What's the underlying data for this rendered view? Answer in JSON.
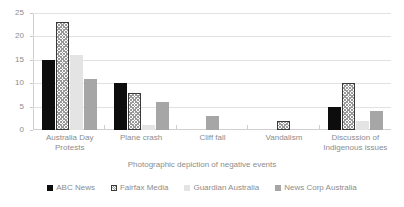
{
  "chart_data": {
    "type": "bar",
    "title": "",
    "xlabel": "Photographic depiction of negative events",
    "ylabel": "",
    "ylim": [
      0,
      25
    ],
    "yticks": [
      0,
      5,
      10,
      15,
      20,
      25
    ],
    "grid": true,
    "legend_position": "bottom",
    "categories": [
      "Australia Day Protests",
      "Plane crash",
      "Cliff fall",
      "Vandalism",
      "Discussion of Indigenous issues"
    ],
    "series": [
      {
        "name": "ABC News",
        "color": "#0d0d0d",
        "values": [
          15,
          10,
          0,
          0,
          5
        ]
      },
      {
        "name": "Fairfax Media",
        "color": "#ffffff",
        "values": [
          23,
          8,
          0,
          2,
          10
        ]
      },
      {
        "name": "Guardian Australia",
        "color": "#e4e4e4",
        "values": [
          16,
          1,
          0,
          0,
          2
        ]
      },
      {
        "name": "News Corp Australia",
        "color": "#a6a6a6",
        "values": [
          11,
          6,
          3,
          0,
          4
        ]
      }
    ]
  }
}
